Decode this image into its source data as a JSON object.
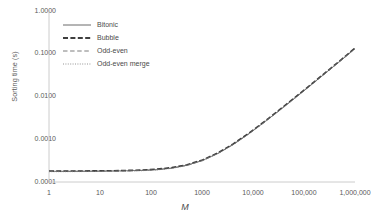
{
  "chart_data": {
    "type": "line",
    "title": "",
    "subtitle": "",
    "xlabel": "M",
    "ylabel": "Sorting time (s)",
    "xscale": "log",
    "yscale": "log",
    "xlim": [
      1,
      1000000
    ],
    "ylim": [
      0.0001,
      1.0
    ],
    "grid": false,
    "legend_position": "upper-left-inside",
    "x_tick_labels": [
      "1",
      "10",
      "100",
      "1000",
      "10,000",
      "100,000",
      "1,000,000"
    ],
    "x_tick_values": [
      1,
      10,
      100,
      1000,
      10000,
      100000,
      1000000
    ],
    "y_tick_labels": [
      "1.0000",
      "0.1000",
      "0.0100",
      "0.0010",
      "0.0001"
    ],
    "y_tick_values": [
      1.0,
      0.1,
      0.01,
      0.001,
      0.0001
    ],
    "x": [
      1,
      2,
      4,
      8,
      16,
      32,
      64,
      128,
      256,
      512,
      1024,
      2048,
      4096,
      8192,
      16384,
      32768,
      65536,
      131072,
      262144,
      524288,
      1000000
    ],
    "series": [
      {
        "name": "Bitonic",
        "style": "solid",
        "color": "#595959",
        "width": 0.8,
        "values": [
          0.000178,
          0.000178,
          0.000179,
          0.00018,
          0.000181,
          0.000183,
          0.000187,
          0.000195,
          0.000212,
          0.000248,
          0.00032,
          0.000468,
          0.00076,
          0.00134,
          0.00248,
          0.00472,
          0.00915,
          0.0179,
          0.0352,
          0.0695,
          0.133
        ]
      },
      {
        "name": "Bubble",
        "style": "dashed-bold",
        "color": "#3f3f3f",
        "width": 1.6,
        "values": [
          0.00018,
          0.00018,
          0.000181,
          0.000182,
          0.000183,
          0.000186,
          0.00019,
          0.000199,
          0.000217,
          0.000254,
          0.000328,
          0.000479,
          0.000779,
          0.00137,
          0.00254,
          0.00484,
          0.00938,
          0.0183,
          0.0361,
          0.0712,
          0.136
        ]
      },
      {
        "name": "Odd-even",
        "style": "dashed",
        "color": "#6e6e6e",
        "width": 0.8,
        "values": [
          0.000176,
          0.000176,
          0.000177,
          0.000178,
          0.000179,
          0.000181,
          0.000185,
          0.000193,
          0.00021,
          0.000245,
          0.000317,
          0.000463,
          0.000752,
          0.00132,
          0.00245,
          0.00467,
          0.00906,
          0.0177,
          0.0348,
          0.0688,
          0.131
        ]
      },
      {
        "name": "Odd-even merge",
        "style": "dotted",
        "color": "#7a7a7a",
        "width": 0.7,
        "values": [
          0.000174,
          0.000174,
          0.000175,
          0.000176,
          0.000177,
          0.000179,
          0.000183,
          0.000191,
          0.000208,
          0.000243,
          0.000314,
          0.000459,
          0.000745,
          0.00131,
          0.00243,
          0.00463,
          0.00898,
          0.0176,
          0.0345,
          0.0682,
          0.13
        ]
      }
    ]
  },
  "legend": {
    "items": [
      {
        "label": "Bitonic"
      },
      {
        "label": "Bubble"
      },
      {
        "label": "Odd-even"
      },
      {
        "label": "Odd-even merge"
      }
    ]
  },
  "axes": {
    "y_title": "Sorting time (s)",
    "x_title": "M"
  },
  "colors": {
    "axis_line": "#bfbfbf",
    "tick_text": "#595959",
    "plot_background": "#ffffff"
  }
}
